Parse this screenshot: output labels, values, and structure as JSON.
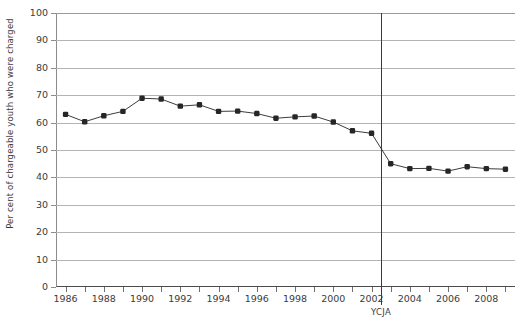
{
  "chart_data": {
    "type": "line",
    "title": "",
    "xlabel": "",
    "ylabel": "Per cent of chargeable youth who were charged",
    "ylim": [
      0,
      100
    ],
    "ytick_step": 10,
    "yticks": [
      0,
      10,
      20,
      30,
      40,
      50,
      60,
      70,
      80,
      90,
      100
    ],
    "xlim": [
      1986,
      2009
    ],
    "xticks": [
      1986,
      1987,
      1988,
      1989,
      1990,
      1991,
      1992,
      1993,
      1994,
      1995,
      1996,
      1997,
      1998,
      1999,
      2000,
      2001,
      2002,
      2003,
      2004,
      2005,
      2006,
      2007,
      2008,
      2009
    ],
    "xtick_labels_shown": [
      1986,
      1988,
      1990,
      1992,
      1994,
      1996,
      1998,
      2000,
      2002,
      2004,
      2006,
      2008
    ],
    "grid": true,
    "legend": false,
    "marker": "square",
    "series_color": "#262626",
    "grid_color": "#b4b4b4",
    "x": [
      1986,
      1987,
      1988,
      1989,
      1990,
      1991,
      1992,
      1993,
      1994,
      1995,
      1996,
      1997,
      1998,
      1999,
      2000,
      2001,
      2002,
      2003,
      2004,
      2005,
      2006,
      2007,
      2008,
      2009
    ],
    "values": [
      63.0,
      60.3,
      62.5,
      64.1,
      68.9,
      68.6,
      66.0,
      66.5,
      64.1,
      64.2,
      63.3,
      61.6,
      62.1,
      62.4,
      60.2,
      57.0,
      56.1,
      45.0,
      43.2,
      43.3,
      42.3,
      43.9,
      43.2,
      43.0
    ],
    "annotations": [
      {
        "label": "YCJA",
        "x": 2002.5
      }
    ]
  },
  "axis": {
    "y_title": "Per cent of chargeable youth who were charged"
  }
}
